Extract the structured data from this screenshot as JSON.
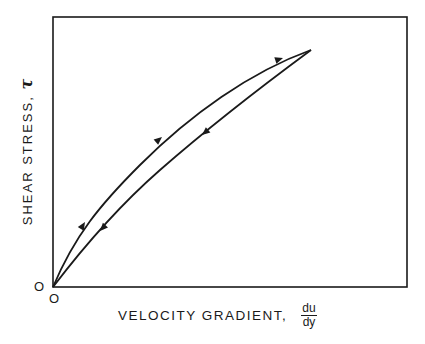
{
  "diagram": {
    "y_axis_label": "SHEAR STRESS,",
    "y_axis_symbol": "τ",
    "x_axis_label": "VELOCITY GRADIENT,",
    "x_axis_fraction": {
      "numerator": "du",
      "denominator": "dy"
    },
    "origin_y": "O",
    "origin_x": "O",
    "curves": [
      {
        "name": "loading-curve",
        "direction": "up",
        "shape": "concave-down from origin to peak"
      },
      {
        "name": "unloading-curve",
        "direction": "down",
        "shape": "near-linear from peak back to origin"
      }
    ]
  }
}
